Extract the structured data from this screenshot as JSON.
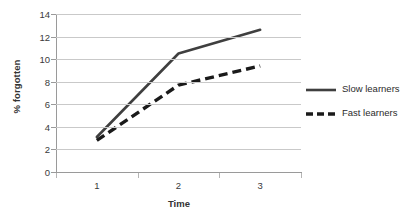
{
  "chart_data": {
    "type": "line",
    "title": "",
    "subtitle": "",
    "xlabel": "Time",
    "ylabel": "% forgotten",
    "categories": [
      "1",
      "2",
      "3"
    ],
    "x": [
      1,
      2,
      3
    ],
    "ylim": [
      0,
      14
    ],
    "yticks": [
      "0",
      "2",
      "4",
      "6",
      "8",
      "10",
      "12",
      "14"
    ],
    "ytick_values": [
      0,
      2,
      4,
      6,
      8,
      10,
      12,
      14
    ],
    "grid": "horizontal",
    "legend_position": "right",
    "series": [
      {
        "name": "Slow learners",
        "values": [
          3.1,
          10.5,
          12.6
        ],
        "style": "solid",
        "color": "#3f3f3f"
      },
      {
        "name": "Fast learners",
        "values": [
          2.8,
          7.7,
          9.4
        ],
        "style": "dashed",
        "color": "#1a1a1a"
      }
    ]
  },
  "colors": {
    "gridline": "#c9c9c9",
    "axis": "#9a9a9a",
    "background": "#ffffff",
    "slow_learners": "#3f3f3f",
    "fast_learners": "#1a1a1a"
  }
}
